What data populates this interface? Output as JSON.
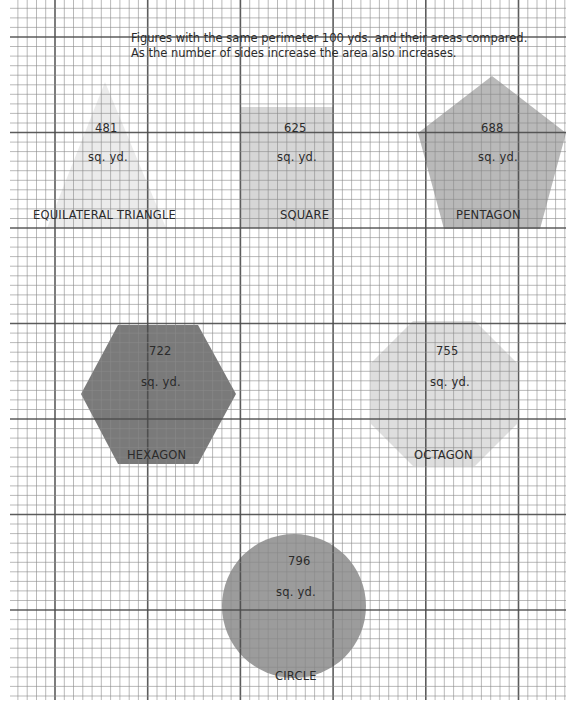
{
  "title": {
    "line1": "Figures with the same perimeter 100 yds. and their areas compared.",
    "line2": "As the number of sides increase the area also increases."
  },
  "unit": "sq. yd.",
  "colors": {
    "paper": "#ffffff",
    "grid_minor": "#8a8a8a",
    "grid_major": "#4a4a4a",
    "triangle": "#ebebeb",
    "square": "#d6d6d6",
    "pentagon": "#b9b9b9",
    "hexagon": "#7a7a7a",
    "octagon": "#dedede",
    "circle": "#9c9c9c"
  },
  "shapes": [
    {
      "id": "triangle",
      "name": "EQUILATERAL TRIANGLE",
      "area": "481",
      "sides": 3
    },
    {
      "id": "square",
      "name": "SQUARE",
      "area": "625",
      "sides": 4
    },
    {
      "id": "pentagon",
      "name": "PENTAGON",
      "area": "688",
      "sides": 5
    },
    {
      "id": "hexagon",
      "name": "HEXAGON",
      "area": "722",
      "sides": 6
    },
    {
      "id": "octagon",
      "name": "OCTAGON",
      "area": "755",
      "sides": 8
    },
    {
      "id": "circle",
      "name": "CIRCLE",
      "area": "796",
      "sides": 0
    }
  ]
}
